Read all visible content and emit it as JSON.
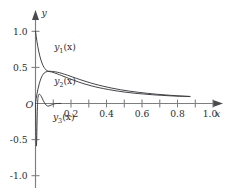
{
  "chart_data": {
    "type": "line",
    "title": "",
    "subtitle": "",
    "xlabel": "x",
    "ylabel": "y",
    "origin_label": "O",
    "xlim": [
      0.0,
      1.08
    ],
    "ylim": [
      -1.15,
      1.12
    ],
    "grid": false,
    "legend_position": "inline-annotations",
    "x_ticks": [
      0.2,
      0.4,
      0.6,
      0.8,
      1.0
    ],
    "x_tick_labels": [
      "0.2",
      "0.4",
      "0.6",
      "0.8",
      "1.0"
    ],
    "x_minor_ticks": [
      0.1,
      0.3,
      0.5,
      0.7,
      0.9
    ],
    "y_ticks": [
      1.0,
      0.5,
      -0.5,
      -1.0
    ],
    "y_tick_labels": [
      "1.0",
      "0.5",
      "-0.5",
      "-1.0"
    ],
    "series": [
      {
        "name": "y1(x)",
        "label_text": "y",
        "label_sub": "1",
        "label_arg": "(x)",
        "label_x": 0.105,
        "label_y": 0.735,
        "color": "#3a3a3e",
        "x": [
          0.0,
          0.004,
          0.008,
          0.013,
          0.018,
          0.024,
          0.031,
          0.039,
          0.048,
          0.058,
          0.068,
          0.078,
          0.09,
          0.105,
          0.125,
          0.15,
          0.18,
          0.21,
          0.25,
          0.29,
          0.33,
          0.38,
          0.43,
          0.48,
          0.53,
          0.58,
          0.63,
          0.68,
          0.73,
          0.78,
          0.82,
          0.855,
          0.87
        ],
        "y": [
          1.0,
          0.93,
          0.862,
          0.79,
          0.725,
          0.66,
          0.6,
          0.545,
          0.5,
          0.468,
          0.452,
          0.447,
          0.445,
          0.441,
          0.432,
          0.416,
          0.392,
          0.366,
          0.332,
          0.3,
          0.271,
          0.24,
          0.213,
          0.19,
          0.171,
          0.155,
          0.141,
          0.129,
          0.119,
          0.11,
          0.104,
          0.1,
          0.098
        ]
      },
      {
        "name": "y2(x)",
        "label_text": "y",
        "label_sub": "2",
        "label_arg": "(x)",
        "label_x": 0.105,
        "label_y": 0.268,
        "color": "#3a3a3e",
        "x": [
          0.0,
          0.004,
          0.009,
          0.015,
          0.022,
          0.03,
          0.039,
          0.049,
          0.059,
          0.069,
          0.08,
          0.092,
          0.107,
          0.125,
          0.148,
          0.175,
          0.205,
          0.24,
          0.28,
          0.32,
          0.36,
          0.41,
          0.46,
          0.51,
          0.56,
          0.61,
          0.66,
          0.71,
          0.76,
          0.81,
          0.845,
          0.87
        ],
        "y": [
          0.0,
          0.072,
          0.142,
          0.213,
          0.281,
          0.342,
          0.39,
          0.422,
          0.438,
          0.444,
          0.442,
          0.436,
          0.424,
          0.408,
          0.386,
          0.36,
          0.332,
          0.3,
          0.268,
          0.241,
          0.218,
          0.194,
          0.173,
          0.156,
          0.142,
          0.131,
          0.121,
          0.113,
          0.106,
          0.101,
          0.098,
          0.096
        ]
      },
      {
        "name": "y3(x)",
        "label_text": "y",
        "label_sub": "3",
        "label_arg": "(x)",
        "label_x": 0.098,
        "label_y": -0.235,
        "color": "#3a3a3e",
        "x": [
          0.0,
          0.0016,
          0.0032,
          0.0048,
          0.0062,
          0.0076,
          0.009,
          0.0106,
          0.0124,
          0.0145,
          0.017,
          0.0205,
          0.0245,
          0.029,
          0.034,
          0.039,
          0.0445,
          0.05,
          0.0555,
          0.061,
          0.066,
          0.071,
          0.0765,
          0.082,
          0.088,
          0.095,
          0.103,
          0.112,
          0.122,
          0.133,
          0.143
        ],
        "y": [
          0.0,
          -0.21,
          -0.44,
          -0.585,
          -0.545,
          -0.4,
          -0.23,
          -0.075,
          0.035,
          0.09,
          0.116,
          0.128,
          0.126,
          0.113,
          0.092,
          0.066,
          0.038,
          0.012,
          -0.009,
          -0.024,
          -0.033,
          -0.036,
          -0.034,
          -0.029,
          -0.022,
          -0.014,
          -0.007,
          -0.002,
          0.0,
          0.001,
          0.0
        ]
      }
    ]
  }
}
